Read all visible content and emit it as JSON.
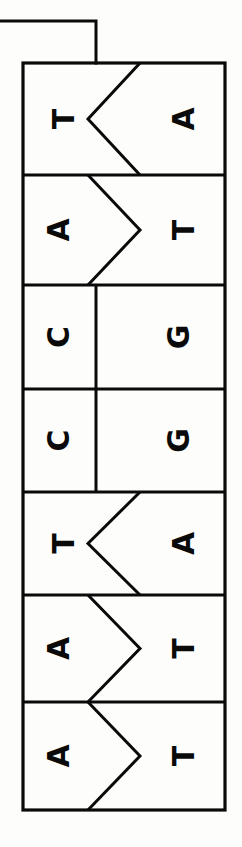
{
  "figure": {
    "orientation": "rotated-90",
    "background_color": "#fdfdfb",
    "stroke_color": "#0a0a0a",
    "letter_color": "#0a0a0a"
  },
  "leader_line": {
    "name": "pointer-leader-line",
    "from_x": 0,
    "corner_x": 96,
    "corner_y": 21,
    "to_y": 63
  },
  "ladder": {
    "left": 23,
    "right": 225,
    "top": 63,
    "bottom": 810,
    "midline_x": 96,
    "row_dividers": [
      175,
      285,
      389,
      492,
      595,
      702
    ]
  },
  "chart_data": {
    "type": "diagram",
    "xlabel": "",
    "ylabel": "",
    "legend": [],
    "rows": [
      {
        "index": 0,
        "left_base": "T",
        "right_base": "A",
        "pair": "T-A",
        "interface": "notch-left",
        "top": 63,
        "bottom": 175
      },
      {
        "index": 1,
        "left_base": "A",
        "right_base": "T",
        "pair": "A-T",
        "interface": "point-right",
        "top": 175,
        "bottom": 285
      },
      {
        "index": 2,
        "left_base": "C",
        "right_base": "G",
        "pair": "C-G",
        "interface": "flat",
        "top": 285,
        "bottom": 389
      },
      {
        "index": 3,
        "left_base": "C",
        "right_base": "G",
        "pair": "C-G",
        "interface": "flat",
        "top": 389,
        "bottom": 492
      },
      {
        "index": 4,
        "left_base": "T",
        "right_base": "A",
        "pair": "T-A",
        "interface": "notch-left",
        "top": 492,
        "bottom": 595
      },
      {
        "index": 5,
        "left_base": "A",
        "right_base": "T",
        "pair": "A-T",
        "interface": "point-right",
        "top": 595,
        "bottom": 702
      },
      {
        "index": 6,
        "left_base": "A",
        "right_base": "T",
        "pair": "A-T",
        "interface": "point-right",
        "top": 702,
        "bottom": 810
      }
    ],
    "left_strand_sequence": "T A C C T A A",
    "right_strand_sequence": "A T G G A T T"
  }
}
